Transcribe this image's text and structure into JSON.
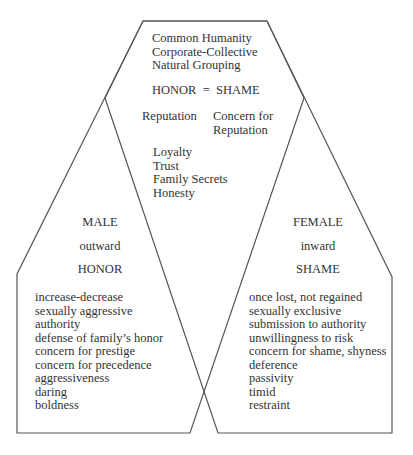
{
  "diagram": {
    "stroke_color": "#555555",
    "top": {
      "lines": [
        "Common Humanity",
        "Corporate-Collective",
        "Natural Grouping"
      ],
      "equation": "HONOR  =  SHAME",
      "reputation_left": "Reputation",
      "reputation_right": [
        "Concern for",
        "Reputation"
      ],
      "values": [
        "Loyalty",
        "Trust",
        "Family Secrets",
        "Honesty"
      ]
    },
    "male": {
      "title": "MALE",
      "direction": "outward",
      "concept": "HONOR",
      "traits": [
        "increase-decrease",
        "sexually aggressive",
        "authority",
        "defense of family’s honor",
        "concern for prestige",
        "concern for precedence",
        "aggressiveness",
        "daring",
        "boldness"
      ]
    },
    "female": {
      "title": "FEMALE",
      "direction": "inward",
      "concept": "SHAME",
      "traits": [
        "once lost, not regained",
        "sexually exclusive",
        "submission to authority",
        "unwillingness to risk",
        "concern for shame, shyness",
        "deference",
        "passivity",
        "timid",
        "restraint"
      ]
    }
  }
}
